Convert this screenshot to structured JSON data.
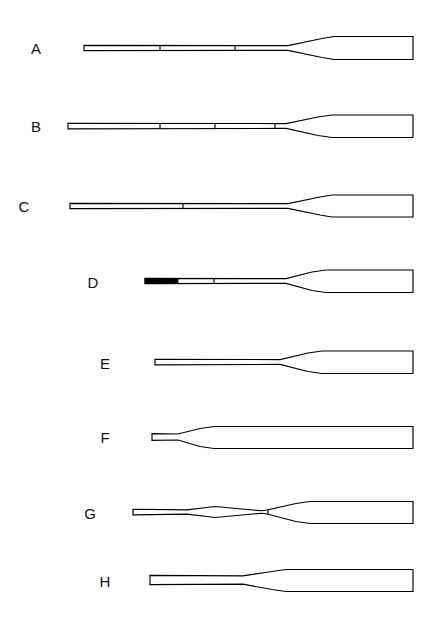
{
  "figure": {
    "background_color": "#ffffff",
    "line_color": "#000000",
    "label_color": "#111111",
    "canvas_width": 433,
    "canvas_height": 624
  },
  "specimens": [
    {
      "label": "A",
      "label_x": 36,
      "label_y": 54,
      "center_y": 48,
      "grip_x": 84,
      "blade_tip_x": 413,
      "shaft_half_height": 2.4,
      "grip_half_height": 2.6,
      "throat_x": 288,
      "shoulder_x": 322,
      "blade_top_y_offset": -11.5,
      "blade_bottom_y_offset": 11.5,
      "blade_lead_x": 334,
      "solid_grip": false,
      "solid_grip_x2": 0,
      "ticks": [
        160,
        235
      ],
      "shape_note": "long slender loom, gradual spoon, square blade tip"
    },
    {
      "label": "B",
      "label_x": 36,
      "label_y": 132,
      "center_y": 126,
      "grip_x": 68,
      "blade_tip_x": 413,
      "shaft_half_height": 2.4,
      "grip_half_height": 2.8,
      "throat_x": 286,
      "shoulder_x": 318,
      "blade_top_y_offset": -11.0,
      "blade_bottom_y_offset": 11.5,
      "blade_lead_x": 332,
      "solid_grip": false,
      "solid_grip_x2": 0,
      "ticks": [
        160,
        215,
        275
      ],
      "shape_note": "longest loom, three collar bands, slight rising grip"
    },
    {
      "label": "C",
      "label_x": 24,
      "label_y": 212,
      "center_y": 206,
      "grip_x": 70,
      "blade_tip_x": 413,
      "shaft_half_height": 2.4,
      "grip_half_height": 2.6,
      "throat_x": 288,
      "shoulder_x": 320,
      "blade_top_y_offset": -11.0,
      "blade_bottom_y_offset": 11.0,
      "blade_lead_x": 332,
      "solid_grip": false,
      "solid_grip_x2": 0,
      "ticks": [
        183
      ],
      "shape_note": "single collar band near mid loom"
    },
    {
      "label": "D",
      "label_x": 93,
      "label_y": 288,
      "center_y": 281,
      "grip_x": 145,
      "blade_tip_x": 413,
      "shaft_half_height": 2.4,
      "grip_half_height": 2.6,
      "throat_x": 286,
      "shoulder_x": 312,
      "blade_top_y_offset": -11.0,
      "blade_bottom_y_offset": 11.5,
      "blade_lead_x": 326,
      "solid_grip": true,
      "solid_grip_x2": 178,
      "ticks": [
        214
      ],
      "shape_note": "blackened grip end, one collar band"
    },
    {
      "label": "E",
      "label_x": 105,
      "label_y": 369,
      "center_y": 362,
      "grip_x": 155,
      "blade_tip_x": 413,
      "shaft_half_height": 2.4,
      "grip_half_height": 2.8,
      "throat_x": 280,
      "shoulder_x": 308,
      "blade_top_y_offset": -11.0,
      "blade_bottom_y_offset": 11.5,
      "blade_lead_x": 322,
      "solid_grip": false,
      "solid_grip_x2": 0,
      "ticks": [],
      "shape_note": "plain loom, no collar bands"
    },
    {
      "label": "F",
      "label_x": 105,
      "label_y": 443,
      "center_y": 437,
      "grip_x": 152,
      "blade_tip_x": 413,
      "shaft_half_height": 3.0,
      "grip_half_height": 3.4,
      "throat_x": 178,
      "shoulder_x": 200,
      "blade_top_y_offset": -10.5,
      "blade_bottom_y_offset": 11.5,
      "blade_lead_x": 214,
      "solid_grip": false,
      "solid_grip_x2": 0,
      "ticks": [],
      "shape_note": "very short loom, exceptionally long blade"
    },
    {
      "label": "G",
      "label_x": 90,
      "label_y": 519,
      "center_y": 512,
      "grip_x": 133,
      "blade_tip_x": 413,
      "shaft_half_height": 2.2,
      "grip_half_height": 2.8,
      "throat_x": 268,
      "shoulder_x": 296,
      "blade_top_y_offset": -10.5,
      "blade_bottom_y_offset": 11.5,
      "blade_lead_x": 310,
      "solid_grip": false,
      "solid_grip_x2": 0,
      "ticks": [
        268
      ],
      "shape_note": "lenticular swelling on mid loom, lens-shaped boss",
      "boss": {
        "start_x": 187,
        "peak_x": 215,
        "end_x": 262,
        "peak_half_height": 5.5
      }
    },
    {
      "label": "H",
      "label_x": 105,
      "label_y": 587,
      "center_y": 580,
      "grip_x": 150,
      "blade_tip_x": 413,
      "shaft_half_height": 4.2,
      "grip_half_height": 4.6,
      "throat_x": 243,
      "shoulder_x": 272,
      "blade_top_y_offset": -10.5,
      "blade_bottom_y_offset": 11.5,
      "blade_lead_x": 286,
      "solid_grip": false,
      "solid_grip_x2": 0,
      "ticks": [],
      "shape_note": "thick stubby loom, broad blade"
    }
  ]
}
